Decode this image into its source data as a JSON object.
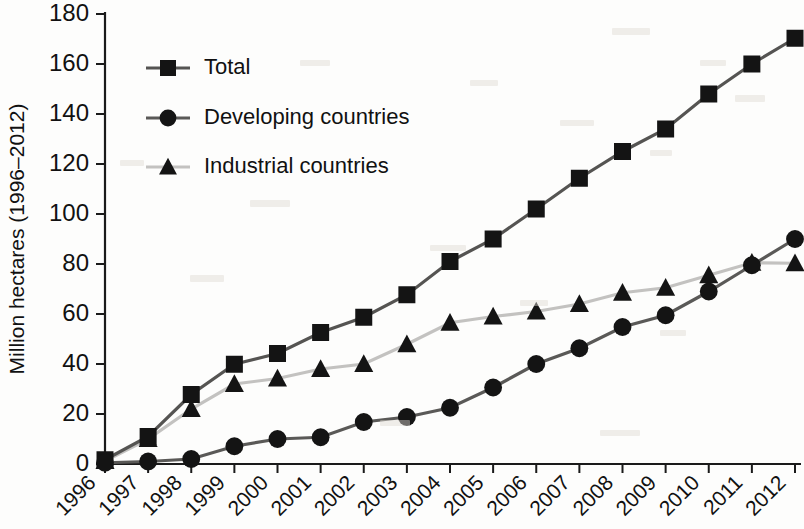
{
  "chart_data": {
    "type": "line",
    "title": "",
    "xlabel": "",
    "ylabel": "Million hectares (1996–2012)",
    "x": [
      1996,
      1997,
      1998,
      1999,
      2000,
      2001,
      2002,
      2003,
      2004,
      2005,
      2006,
      2007,
      2008,
      2009,
      2010,
      2011,
      2012
    ],
    "categories": [
      "1996",
      "1997",
      "1998",
      "1999",
      "2000",
      "2001",
      "2002",
      "2003",
      "2004",
      "2005",
      "2006",
      "2007",
      "2008",
      "2009",
      "2010",
      "2011",
      "2012"
    ],
    "xlim": [
      1996,
      2012
    ],
    "ylim": [
      0,
      180
    ],
    "yticks": [
      0,
      20,
      40,
      60,
      80,
      100,
      120,
      140,
      160,
      180
    ],
    "grid": false,
    "legend_position": "upper-left",
    "series": [
      {
        "name": "Total",
        "marker": "square",
        "color": "#141414",
        "line_color": "#555452",
        "values": [
          1.7,
          11.0,
          27.8,
          39.9,
          44.2,
          52.6,
          58.7,
          67.7,
          81.0,
          90.0,
          102.0,
          114.3,
          125.0,
          134.0,
          148.0,
          160.0,
          170.3
        ]
      },
      {
        "name": "Developing countries",
        "marker": "circle",
        "color": "#141414",
        "line_color": "#5a5957",
        "values": [
          0.5,
          1.0,
          2.0,
          7.1,
          10.0,
          10.7,
          16.8,
          18.8,
          22.5,
          30.6,
          40.0,
          46.3,
          54.8,
          59.5,
          69.0,
          79.5,
          90.0
        ]
      },
      {
        "name": "Industrial countries",
        "marker": "triangle",
        "color": "#141414",
        "line_color": "#c3c2c0",
        "values": [
          1.2,
          10.0,
          22.0,
          32.0,
          34.2,
          38.0,
          40.0,
          47.9,
          56.5,
          59.0,
          61.0,
          64.0,
          68.5,
          70.5,
          75.5,
          80.5,
          80.3
        ]
      }
    ]
  },
  "legend": {
    "items": [
      {
        "label": "Total",
        "marker": "square"
      },
      {
        "label": "Developing countries",
        "marker": "circle"
      },
      {
        "label": "Industrial countries",
        "marker": "triangle"
      }
    ]
  },
  "axes": {
    "y_title": "Million hectares (1996–2012)",
    "y_tick_labels": [
      "0",
      "20",
      "40",
      "60",
      "80",
      "100",
      "120",
      "140",
      "160",
      "180"
    ],
    "x_tick_labels": [
      "1996",
      "1997",
      "1998",
      "1999",
      "2000",
      "2001",
      "2002",
      "2003",
      "2004",
      "2005",
      "2006",
      "2007",
      "2008",
      "2009",
      "2010",
      "2011",
      "2012"
    ]
  }
}
